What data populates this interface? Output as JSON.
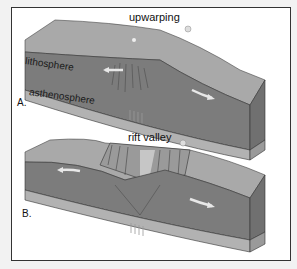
{
  "figure": {
    "panel_a": {
      "letter": "A.",
      "title": "upwarping",
      "layers": [
        "lithosphere",
        "asthenosphere"
      ]
    },
    "panel_b": {
      "letter": "B.",
      "title": "rift valley"
    }
  },
  "colors": {
    "top_surface": "#a8a8a8",
    "lithosphere": "#7a7a7a",
    "asthenosphere": "#b4b4b4",
    "side_face": "#6e6e6e",
    "arrow": "#e6e6e6",
    "frame_border": "#333333"
  }
}
